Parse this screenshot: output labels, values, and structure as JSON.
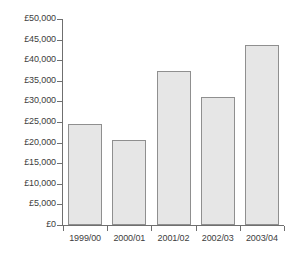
{
  "chart_data": {
    "type": "bar",
    "title": "",
    "subtitle": "",
    "xlabel": "",
    "ylabel": "",
    "categories": [
      "1999/00",
      "2000/01",
      "2001/02",
      "2002/03",
      "2003/04"
    ],
    "values": [
      24600,
      20700,
      37400,
      31000,
      43700
    ],
    "ylim": [
      0,
      50000
    ],
    "ytick_step": 5000,
    "ytick_labels": [
      "£0",
      "£5,000",
      "£10,000",
      "£15,000",
      "£20,000",
      "£25,000",
      "£30,000",
      "£35,000",
      "£40,000",
      "£45,000",
      "£50,000"
    ],
    "ytick_values": [
      0,
      5000,
      10000,
      15000,
      20000,
      25000,
      30000,
      35000,
      40000,
      45000,
      50000
    ],
    "grid": false,
    "legend": null,
    "legend_position": "none",
    "currency_symbol": "£",
    "series": [
      {
        "name": "",
        "values": [
          24600,
          20700,
          37400,
          31000,
          43700
        ]
      }
    ],
    "colors": {
      "bar_fill": "#e6e6e6",
      "bar_border": "#8f8f8f",
      "axis": "#6f6f6f",
      "text": "#3d3d3d",
      "background": "#ffffff"
    }
  }
}
